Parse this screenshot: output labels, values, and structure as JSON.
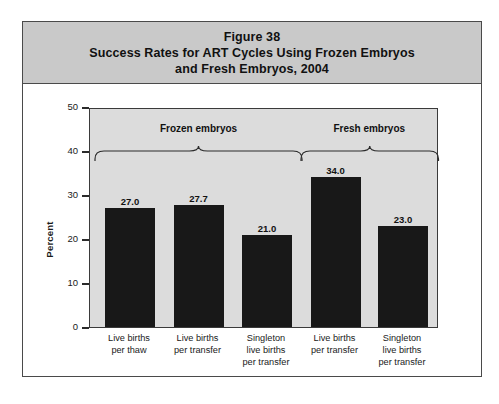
{
  "figure": {
    "title_lines": [
      "Figure 38",
      "Success Rates for ART Cycles Using Frozen Embryos",
      "and Fresh Embryos, 2004"
    ],
    "frame_color": "#4a4a4a",
    "title_band_color": "#c9c9c9",
    "plot_background_color": "#dcdcdc",
    "bar_color": "#181818"
  },
  "chart_data": {
    "type": "bar",
    "xlabel": "",
    "ylabel": "Percent",
    "ylim": [
      0,
      50
    ],
    "yticks": [
      0,
      10,
      20,
      30,
      40,
      50
    ],
    "ytick_labels": [
      "0",
      "10",
      "20",
      "30",
      "40",
      "50"
    ],
    "grid": false,
    "legend": null,
    "categories": [
      "Live births\nper thaw",
      "Live births\nper transfer",
      "Singleton\nlive births\nper transfer",
      "Live births\nper transfer",
      "Singleton\nlive births\nper transfer"
    ],
    "values": [
      27.0,
      27.7,
      21.0,
      34.0,
      23.0
    ],
    "value_labels": [
      "27.0",
      "27.7",
      "21.0",
      "34.0",
      "23.0"
    ],
    "groups": [
      {
        "label": "Frozen embryos",
        "category_indices": [
          0,
          1,
          2
        ]
      },
      {
        "label": "Fresh embryos",
        "category_indices": [
          3,
          4
        ]
      }
    ]
  }
}
